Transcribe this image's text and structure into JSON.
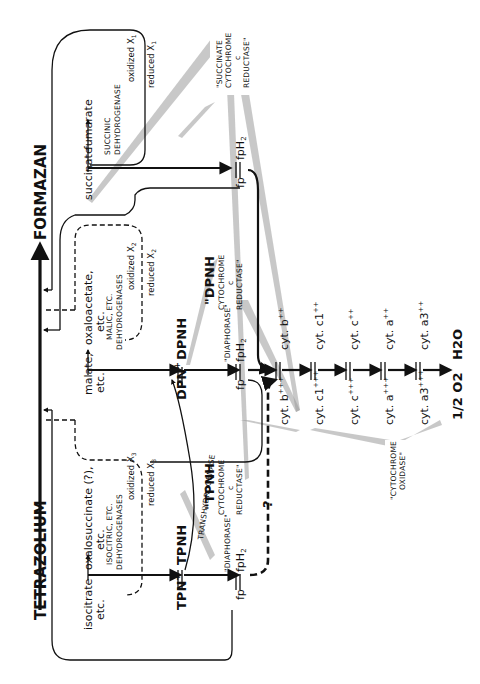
{
  "diagram": {
    "orientation": "rotated 90deg counter-clockwise",
    "colors": {
      "ink": "#111111",
      "background": "#ffffff",
      "beam": "#9a9a9a"
    },
    "main_axis": {
      "start": "TETRAZOLIUM",
      "end": "FORMAZAN"
    },
    "substrates": {
      "succinate": {
        "substrate": "succinate",
        "product": "fumarate",
        "enzyme": "SUCCINIC DEHYDROGENASE",
        "oxidized": "oxidized X",
        "reduced": "reduced X",
        "sub": "1"
      },
      "malate": {
        "substrate": "malate,",
        "substrate_2": "etc.",
        "product": "oxaloacetate,",
        "product_2": "etc.",
        "enzyme_1": "MALIC, ETC.",
        "enzyme_2": "DEHYDROGENASES",
        "oxidized": "oxidized X",
        "reduced": "reduced X",
        "sub": "2"
      },
      "isocitrate": {
        "substrate": "isocitrate",
        "substrate_2": "etc.",
        "product": "oxalosuccinate (?),",
        "product_2": "etc.",
        "enzyme_1": "ISOCITRIC, ETC.",
        "enzyme_2": "DEHYDROGENASES",
        "oxidized": "oxidized X",
        "reduced": "reduced X",
        "sub": "3"
      }
    },
    "pyridine_nucleotides": {
      "dpn_ox": "DPN",
      "dpn_red": "DPNH",
      "tpn_ox": "TPN",
      "tpn_red": "TPNH",
      "plus": "+",
      "transhydrogenase": "TRANSHYDROGENASE"
    },
    "flavoproteins": {
      "fp": "fp",
      "fph2": "fpH",
      "sub2": "2",
      "diaphorase": "\"DIAPHORASE\""
    },
    "cytochromes": [
      {
        "reduced": "cyt. b",
        "reduced_charge": "++",
        "oxidized": "cyt. b",
        "oxidized_charge": "+++"
      },
      {
        "reduced": "cyt. c1",
        "reduced_charge": "++",
        "oxidized": "cyt. c1",
        "oxidized_charge": "+++"
      },
      {
        "reduced": "cyt. c",
        "reduced_charge": "++",
        "oxidized": "cyt. c",
        "oxidized_charge": "+++"
      },
      {
        "reduced": "cyt. a",
        "reduced_charge": "++",
        "oxidized": "cyt. a",
        "oxidized_charge": "+++"
      },
      {
        "reduced": "cyt. a3",
        "reduced_charge": "++",
        "oxidized": "cyt. a3",
        "oxidized_charge": "+++"
      }
    ],
    "terminal": {
      "product": "H2O",
      "oxygen": "1/2 O2"
    },
    "enzyme_labels": {
      "succinate_cyt_c_reductase": [
        "\"SUCCINATE",
        "CYTOCHROME",
        "c",
        "REDUCTASE\""
      ],
      "dpnh_cyt_c_reductase": [
        "\"DPNH",
        "CYTOCHROME",
        "c",
        "REDUCTASE\""
      ],
      "tpnh_cyt_c_reductase": [
        "\"TPNH",
        "CYTOCHROME",
        "c",
        "REDUCTASE\""
      ],
      "cytochrome_oxidase": [
        "\"CYTOCHROME",
        "OXIDASE\""
      ]
    },
    "question_mark": "?"
  }
}
